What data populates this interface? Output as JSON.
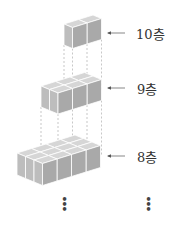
{
  "diagram": {
    "layers": [
      {
        "label": "10층",
        "cols": 2,
        "rows": 1,
        "origin": [
          64,
          24
        ],
        "height": 21,
        "label_y": 33
      },
      {
        "label": "9층",
        "cols": 3,
        "rows": 2,
        "origin": [
          41,
          86
        ],
        "height": 21,
        "label_y": 88
      },
      {
        "label": "8층",
        "cols": 4,
        "rows": 3,
        "origin": [
          17,
          153
        ],
        "height": 22,
        "label_y": 156
      }
    ],
    "continuation_marks": [
      "⋮",
      "⋮"
    ],
    "colors": {
      "cube_top": "#d6d6d6",
      "cube_left": "#bdbdbd",
      "cube_right": "#a9a9a9",
      "edge": "#ffffff",
      "dash": "#b0b0b0",
      "arrow": "#555555"
    }
  }
}
